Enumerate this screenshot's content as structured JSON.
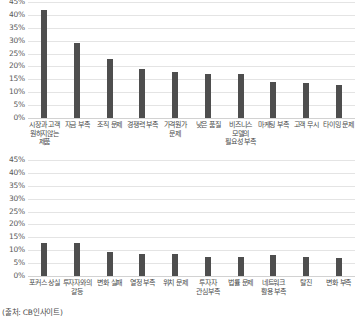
{
  "source_note": "(출처: CB인사이트)",
  "chart_data": [
    {
      "type": "bar",
      "id": "chart-1",
      "title": "",
      "xlabel": "",
      "ylabel": "",
      "ylim": [
        0,
        45
      ],
      "grid": true,
      "legend": "none",
      "tick_labels": [
        "45%",
        "40%",
        "35%",
        "30%",
        "25%",
        "20%",
        "15%",
        "10%",
        "5%",
        "0%"
      ],
      "tick_values": [
        45,
        40,
        35,
        30,
        25,
        20,
        15,
        10,
        5,
        0
      ],
      "categories": [
        "시장과 고객 원하지않는 제품",
        "자금 부족",
        "조직 문제",
        "경쟁력 부족",
        "가격원가 문제",
        "낮은 품질",
        "비즈니스 모델의 필요성 부족",
        "마케팅 부족",
        "고객 무시",
        "타이밍 문제"
      ],
      "values": [
        42,
        29,
        23,
        19,
        18,
        17,
        17,
        14,
        13.5,
        13
      ],
      "bar_color": "#4e4e4e"
    },
    {
      "type": "bar",
      "id": "chart-2",
      "title": "",
      "xlabel": "",
      "ylabel": "",
      "ylim": [
        0,
        45
      ],
      "grid": true,
      "legend": "none",
      "tick_labels": [
        "45%",
        "40%",
        "35%",
        "30%",
        "25%",
        "20%",
        "15%",
        "10%",
        "5%",
        "0%"
      ],
      "tick_values": [
        45,
        40,
        35,
        30,
        25,
        20,
        15,
        10,
        5,
        0
      ],
      "categories": [
        "포커스 상실",
        "투자자와의 갈등",
        "변화 실패",
        "열정 부족",
        "위치 문제",
        "투자자 관심부족",
        "법률 문제",
        "네트워크 활용 부족",
        "탈진",
        "변화 부족"
      ],
      "values": [
        13,
        13,
        9.5,
        8.5,
        8.5,
        7.5,
        7.5,
        8,
        7.5,
        7
      ],
      "bar_color": "#4e4e4e"
    }
  ]
}
